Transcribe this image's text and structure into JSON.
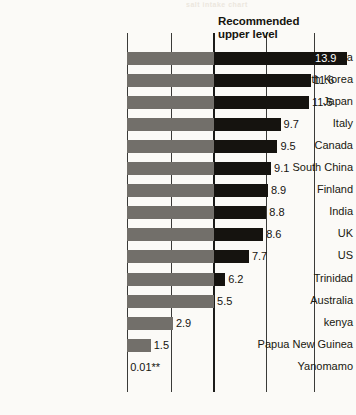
{
  "bleed_text": "salt intake chart",
  "annotation": {
    "line1": "Recommended",
    "line2": "upper level"
  },
  "chart_data": {
    "type": "bar",
    "orientation": "horizontal",
    "title": "",
    "subtitle": "",
    "xlabel": "",
    "ylabel": "",
    "xlim": [
      0,
      14.5
    ],
    "grid": true,
    "gridlines": [
      0,
      2.8,
      5.5,
      8.8,
      11.8
    ],
    "legend_position": "none",
    "reference_line": {
      "label_line1": "Recommended",
      "label_line2": "upper level",
      "value": 5.5
    },
    "categories": [
      "North China",
      "South Korea",
      "Japan",
      "Italy",
      "Canada",
      "South China",
      "Finland",
      "India",
      "UK",
      "US",
      "Trinidad",
      "Australia",
      "kenya",
      "Papua New Guinea",
      "Yanomamo"
    ],
    "values": [
      13.9,
      11.6,
      11.5,
      9.7,
      9.5,
      9.1,
      8.9,
      8.8,
      8.6,
      7.7,
      6.2,
      5.5,
      2.9,
      1.5,
      0.01
    ],
    "value_labels": [
      "13.9",
      "11.6",
      "11.5",
      "9.7",
      "9.5",
      "9.1",
      "8.9",
      "8.8",
      "8.6",
      "7.7",
      "6.2",
      "5.5",
      "2.9",
      "1.5",
      "0.01**"
    ],
    "label_placement": [
      "inside",
      "outside",
      "outside",
      "outside",
      "outside",
      "outside",
      "outside",
      "outside",
      "outside",
      "outside",
      "outside",
      "outside",
      "outside",
      "outside",
      "outside"
    ],
    "colors": {
      "below_reference": "#726f6a",
      "above_reference": "#15130f",
      "background": "#fbfaf7",
      "axis": "#3a3a38",
      "label_inside": "#ffffff",
      "label_outside": "#15130f"
    }
  }
}
